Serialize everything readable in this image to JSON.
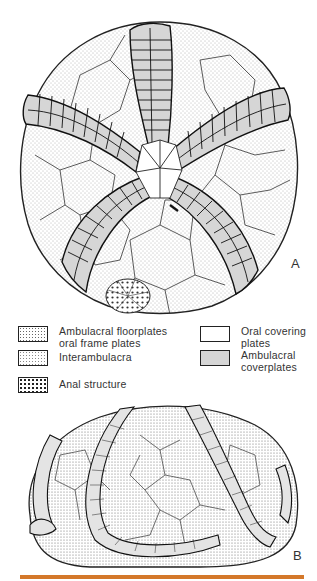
{
  "figure": {
    "panel_a_label": "A",
    "panel_b_label": "B",
    "panel_a_description": "Oral (top) view of edrioasteroid theca with five curved ambulacra",
    "panel_b_description": "Lateral view of edrioasteroid theca"
  },
  "legend": {
    "items": [
      {
        "id": "ambulacral-floorplates",
        "label": "Ambulacral floorplates\n oral frame plates",
        "pattern": "fine-stipple"
      },
      {
        "id": "interambulacra",
        "label": "Interambulacra",
        "pattern": "light-stipple"
      },
      {
        "id": "anal-structure",
        "label": "Anal structure",
        "pattern": "coarse-dots"
      },
      {
        "id": "oral-covering-plates",
        "label": "Oral covering\nplates",
        "pattern": "white"
      },
      {
        "id": "ambulacral-coverplates",
        "label": "Ambulacral\ncoverplates",
        "pattern": "grey"
      }
    ]
  },
  "colors": {
    "rule": "#d4782a",
    "ink": "#222222",
    "coverplate_grey": "#d6d6d6",
    "paper": "#ffffff"
  }
}
